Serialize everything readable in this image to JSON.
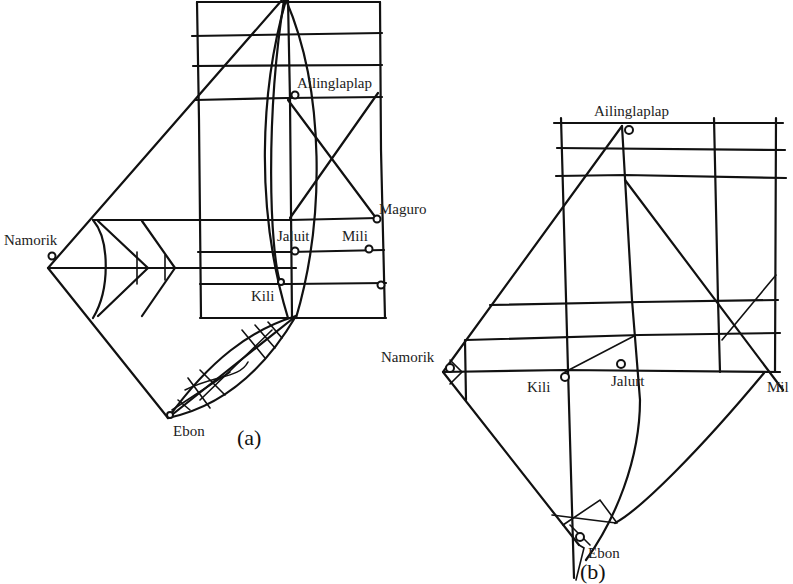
{
  "figure": {
    "panels": [
      {
        "id": "a",
        "caption": "(a)",
        "islands": [
          {
            "name": "Ailinglaplap"
          },
          {
            "name": "Maguro"
          },
          {
            "name": "Namorik"
          },
          {
            "name": "Jaluit"
          },
          {
            "name": "Mili"
          },
          {
            "name": "Kili"
          },
          {
            "name": "Ebon"
          }
        ]
      },
      {
        "id": "b",
        "caption": "(b)",
        "islands": [
          {
            "name": "Ailinglaplap"
          },
          {
            "name": "Namorik"
          },
          {
            "name": "Kili"
          },
          {
            "name": "Jalurt"
          },
          {
            "name": "Mil"
          },
          {
            "name": "Ebon"
          }
        ]
      }
    ],
    "colors": {
      "ink": "#111111",
      "background": "#ffffff"
    }
  }
}
